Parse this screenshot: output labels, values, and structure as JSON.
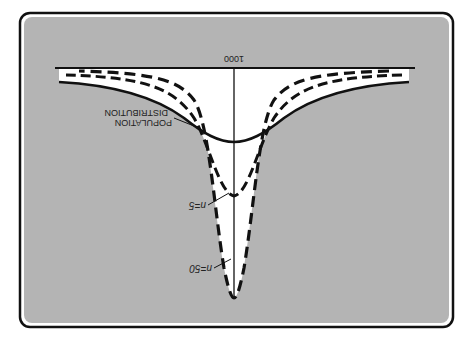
{
  "figure": {
    "orientation": "rotated-180",
    "axis_value_label": "1000",
    "labels": {
      "population_line1": "POPULATION",
      "population_line2": "DISTRIBUTION",
      "n5": "n=5",
      "n50": "n=50"
    },
    "curves": [
      {
        "name": "population-distribution",
        "style": "solid"
      },
      {
        "name": "sampling-distribution-n5",
        "style": "dashed",
        "n": 5
      },
      {
        "name": "sampling-distribution-n50",
        "style": "dashed",
        "n": 50
      }
    ],
    "colors": {
      "panel": "#b4b4b4",
      "curve_fill": "#ffffff",
      "ink": "#111111"
    }
  }
}
